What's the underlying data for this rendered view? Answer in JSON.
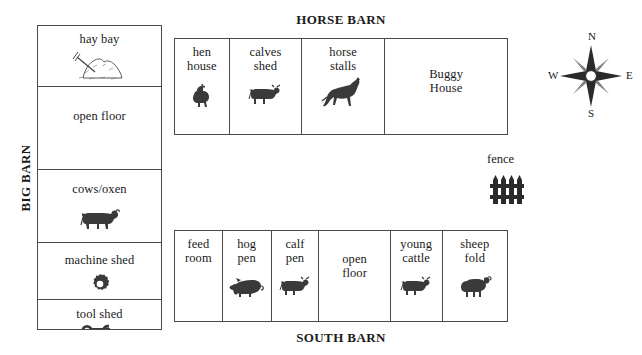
{
  "diagram": {
    "big_barn": {
      "title": "BIG BARN",
      "cells": [
        {
          "label": "hay bay",
          "icon": "haystack-icon"
        },
        {
          "label": "open floor",
          "icon": "none"
        },
        {
          "label": "cows/oxen",
          "icon": "cow-icon"
        },
        {
          "label": "machine shed",
          "icon": "gear-icon"
        },
        {
          "label": "tool shed",
          "icon": "wrench-icon"
        }
      ]
    },
    "horse_barn": {
      "title": "HORSE BARN",
      "cells": [
        {
          "label": "hen\nhouse",
          "icon": "hen-icon"
        },
        {
          "label": "calves\nshed",
          "icon": "calf-icon"
        },
        {
          "label": "horse\nstalls",
          "icon": "horse-icon"
        },
        {
          "label": "Buggy\nHouse",
          "icon": "none"
        }
      ]
    },
    "south_barn": {
      "title": "SOUTH BARN",
      "cells": [
        {
          "label": "feed\nroom",
          "icon": "none"
        },
        {
          "label": "hog\npen",
          "icon": "pig-icon"
        },
        {
          "label": "calf\npen",
          "icon": "calf-icon"
        },
        {
          "label": "open\nfloor",
          "icon": "none"
        },
        {
          "label": "young\ncattle",
          "icon": "calf-icon"
        },
        {
          "label": "sheep\nfold",
          "icon": "sheep-icon"
        }
      ]
    },
    "legend": {
      "fence_label": "fence",
      "fence_icon": "fence-icon"
    },
    "compass": {
      "north": "N",
      "south": "S",
      "east": "E",
      "west": "W",
      "icon": "compass-rose-icon"
    },
    "colors": {
      "ink": "#1a1a1a",
      "line": "#4a4a4a",
      "icon_fill": "#3a3a3a",
      "background": "#ffffff"
    }
  }
}
